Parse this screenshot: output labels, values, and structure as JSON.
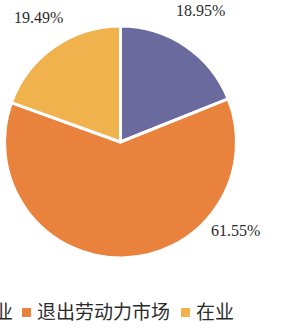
{
  "chart_data": {
    "type": "pie",
    "title": "",
    "subtitle": "",
    "xlabel": "",
    "ylabel": "",
    "grid": false,
    "legend_position": "bottom",
    "start_angle_deg": 0,
    "direction": "clockwise",
    "categories": [
      "业",
      "退出劳动力市场",
      "在业"
    ],
    "values": [
      18.95,
      61.55,
      19.49
    ],
    "value_unit": "%",
    "data_labels": [
      "18.95%",
      "61.55%",
      "19.49%"
    ],
    "colors": [
      "#6A6A9E",
      "#E8823C",
      "#EFB24C"
    ],
    "slices": [
      {
        "label": "业",
        "value": 18.95,
        "data_label": "18.95%",
        "color": "#6A6A9E",
        "start_deg": 0,
        "end_deg": 68.22
      },
      {
        "label": "退出劳动力市场",
        "value": 61.55,
        "data_label": "61.55%",
        "color": "#E8823C",
        "start_deg": 68.22,
        "end_deg": 289.8
      },
      {
        "label": "在业",
        "value": 19.49,
        "data_label": "19.49%",
        "color": "#EFB24C",
        "start_deg": 289.8,
        "end_deg": 360
      }
    ]
  },
  "labels": {
    "gold": "19.49%",
    "purple": "18.95%",
    "orange": "61.55%"
  },
  "legend": {
    "items": [
      {
        "label": "业",
        "color": "#6A6A9E",
        "truncated": true
      },
      {
        "label": "退出劳动力市场",
        "color": "#E8823C",
        "truncated": false
      },
      {
        "label": "在业",
        "color": "#EFB24C",
        "truncated": false
      }
    ]
  }
}
